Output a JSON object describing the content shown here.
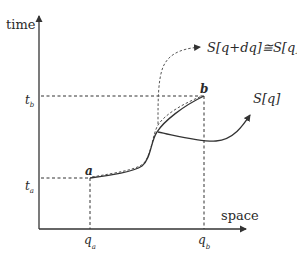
{
  "diagram": {
    "axes": {
      "y_label": "time",
      "x_label": "space"
    },
    "ticks": {
      "t_b": {
        "main": "t",
        "sub": "b"
      },
      "t_a": {
        "main": "t",
        "sub": "a"
      },
      "q_a": {
        "main": "q",
        "sub": "a"
      },
      "q_b": {
        "main": "q",
        "sub": "b"
      }
    },
    "points": {
      "a": "a",
      "b": "b"
    },
    "curves": {
      "varied_path_label": "S[q+dq]≅S[q]",
      "actual_path_label": "S[q]"
    },
    "colors": {
      "ink": "#333333",
      "background": "#ffffff"
    }
  }
}
